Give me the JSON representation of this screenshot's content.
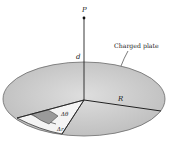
{
  "diagram": {
    "labels": {
      "point": "P",
      "distance": "d",
      "plate": "Charged plate",
      "radius": "R",
      "angle_element": "Δθ",
      "radial_element": "Δr"
    },
    "colors": {
      "plate_fill": "#cfcfcf",
      "plate_edge": "#6a6a6a",
      "wedge_fill": "#f4f4f4",
      "element_fill": "#9a9a9a",
      "line": "#222222"
    }
  }
}
